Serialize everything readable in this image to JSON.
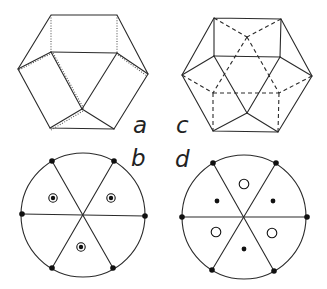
{
  "figure": {
    "panels": [
      {
        "id": "a",
        "label": "a",
        "kind": "polyhedron-perspective",
        "hidden_edges": "dotted"
      },
      {
        "id": "b",
        "label": "b",
        "kind": "stereographic-projection",
        "symbols": "circled-dots"
      },
      {
        "id": "c",
        "label": "c",
        "kind": "polyhedron-perspective",
        "hidden_edges": "dashed"
      },
      {
        "id": "d",
        "label": "d",
        "kind": "stereographic-projection",
        "symbols": "dots-and-open-circles"
      }
    ],
    "colors": {
      "line": "#2a2a2a",
      "background": "#ffffff"
    }
  }
}
